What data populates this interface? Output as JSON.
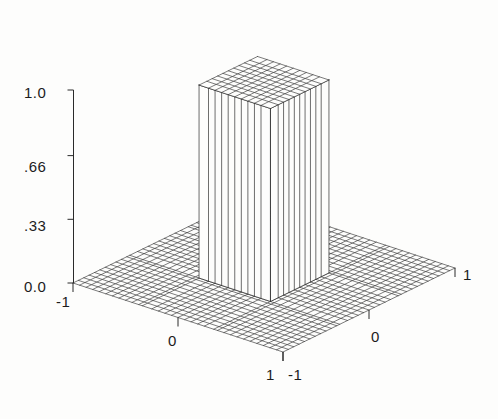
{
  "figure": {
    "background_color": "#fdfdfc",
    "line_color": "#2a2a2a",
    "text_color": "#1c1c1c",
    "width": 498,
    "height": 419
  },
  "axes": {
    "z_ticks": [
      {
        "label": "1.0",
        "value": 1.0
      },
      {
        "label": ".66",
        "value": 0.66
      },
      {
        "label": ".33",
        "value": 0.33
      },
      {
        "label": "0.0",
        "value": 0.0
      }
    ],
    "x_ticks": [
      {
        "label": "-1",
        "value": -1
      },
      {
        "label": "0",
        "value": 0
      },
      {
        "label": "1",
        "value": 1
      }
    ],
    "y_ticks": [
      {
        "label": "-1",
        "value": -1
      },
      {
        "label": "0",
        "value": 0
      },
      {
        "label": "1",
        "value": 1
      }
    ]
  },
  "chart_data": {
    "type": "surface",
    "title": "",
    "xlabel": "",
    "ylabel": "",
    "zlabel": "",
    "xlim": [
      -1,
      1
    ],
    "ylim": [
      -1,
      1
    ],
    "zlim": [
      0,
      1
    ],
    "grid": true,
    "legend": false,
    "mesh": {
      "nx": 33,
      "ny": 33
    },
    "plateau": {
      "x_range": [
        -0.34,
        0.34
      ],
      "y_range": [
        -0.34,
        0.34
      ],
      "height": 1.0,
      "base_height": 0.0
    },
    "z_tick_values": [
      0.0,
      0.33,
      0.66,
      1.0
    ],
    "z_tick_labels": [
      "0.0",
      ".33",
      ".66",
      "1.0"
    ],
    "x_tick_values": [
      -1,
      0,
      1
    ],
    "x_tick_labels": [
      "-1",
      "0",
      "1"
    ],
    "y_tick_values": [
      -1,
      0,
      1
    ],
    "y_tick_labels": [
      "-1",
      "0",
      "1"
    ],
    "view": {
      "azimuth_deg": 45,
      "elevation_deg": 26
    }
  },
  "labels": {
    "z_1_0": "1.0",
    "z_0_66": ".66",
    "z_0_33": ".33",
    "z_0_0": "0.0",
    "x_left_minus1": "-1",
    "x_mid_0": "0",
    "x_front_1": "1",
    "y_front_minus1": "-1",
    "y_mid_0": "0",
    "y_right_1": "1"
  }
}
